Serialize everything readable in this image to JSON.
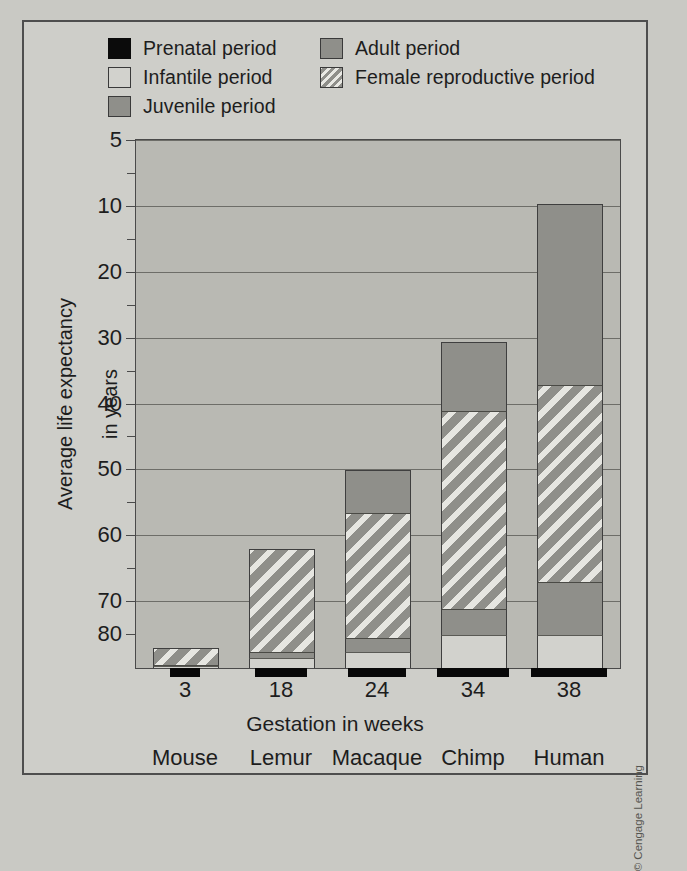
{
  "legend": {
    "items": [
      {
        "label": "Prenatal period",
        "icon": "solid-black-swatch",
        "color": "#0b0b0b",
        "col": "left"
      },
      {
        "label": "Infantile period",
        "icon": "light-grey-swatch",
        "color": "#d2d2cd",
        "col": "left"
      },
      {
        "label": "Juvenile period",
        "icon": "mid-grey-swatch",
        "color": "#8f8f8a",
        "col": "left"
      },
      {
        "label": "Adult period",
        "icon": "mid-grey-swatch",
        "color": "#8f8f8a",
        "col": "right"
      },
      {
        "label": "Female reproductive period",
        "icon": "hatched-swatch",
        "color": "#8f8f8a",
        "col": "right"
      }
    ]
  },
  "axes": {
    "y_title_line1": "Average life expectancy",
    "y_title_line2": "in years",
    "x_title": "Gestation in weeks",
    "y_major_ticks": [
      "80",
      "70",
      "60",
      "50",
      "40",
      "30",
      "20",
      "10",
      "5"
    ],
    "y_minor_ticks": [
      "75",
      "65",
      "55",
      "45",
      "35",
      "25",
      "15"
    ]
  },
  "credit": "© Cengage Learning",
  "chart_data": {
    "type": "bar",
    "stacked": true,
    "title": "",
    "xlabel": "Gestation in weeks",
    "ylabel": "Average life expectancy in years",
    "ylim": [
      0,
      80
    ],
    "ytick_values": [
      5,
      10,
      20,
      30,
      40,
      50,
      60,
      70,
      80
    ],
    "yminor_tick_values": [
      15,
      25,
      35,
      45,
      55,
      65,
      75
    ],
    "grid": true,
    "legend_position": "top",
    "categories": [
      "Mouse",
      "Lemur",
      "Macaque",
      "Chimp",
      "Human"
    ],
    "x": [
      "3",
      "18",
      "24",
      "34",
      "38"
    ],
    "x_units": "weeks gestation",
    "series": [
      {
        "name": "Prenatal period",
        "color": "#0b0b0b",
        "note": "drawn below baseline, proportional to gestation",
        "values": [
          0.06,
          0.35,
          0.46,
          0.65,
          0.73
        ]
      },
      {
        "name": "Infantile period",
        "color": "#d2d2cd",
        "values": [
          0.3,
          1.5,
          2.5,
          5.0,
          5.0
        ]
      },
      {
        "name": "Juvenile period",
        "color": "#8f8f8a",
        "values": [
          0.2,
          1.0,
          2.0,
          4.0,
          8.0
        ]
      },
      {
        "name": "Female reproductive period",
        "color": "#8f8f8a",
        "hatched": true,
        "values": [
          2.5,
          15.5,
          19.0,
          30.0,
          30.0
        ]
      },
      {
        "name": "Adult period",
        "color": "#8f8f8a",
        "values": [
          0.0,
          0.0,
          6.5,
          10.5,
          27.5
        ]
      }
    ],
    "totals": [
      3.0,
      18.0,
      30.0,
      49.5,
      70.5
    ]
  },
  "bars": [
    {
      "species": "Mouse",
      "gestation": "3",
      "left": 17,
      "total": 3.0,
      "segments": [
        {
          "kind": "infantile",
          "label": "Infantile period",
          "value": 0.3
        },
        {
          "kind": "juvenile",
          "label": "Juvenile period",
          "value": 0.2
        },
        {
          "kind": "female",
          "label": "Female reproductive period",
          "value": 2.5
        }
      ]
    },
    {
      "species": "Lemur",
      "gestation": "18",
      "left": 113,
      "total": 18.0,
      "segments": [
        {
          "kind": "infantile",
          "label": "Infantile period",
          "value": 1.5
        },
        {
          "kind": "juvenile",
          "label": "Juvenile period",
          "value": 1.0
        },
        {
          "kind": "female",
          "label": "Female reproductive period",
          "value": 15.5
        }
      ]
    },
    {
      "species": "Macaque",
      "gestation": "24",
      "left": 209,
      "total": 30.0,
      "segments": [
        {
          "kind": "infantile",
          "label": "Infantile period",
          "value": 2.5
        },
        {
          "kind": "juvenile",
          "label": "Juvenile period",
          "value": 2.0
        },
        {
          "kind": "female",
          "label": "Female reproductive period",
          "value": 19.0
        },
        {
          "kind": "adult",
          "label": "Adult period",
          "value": 6.5
        }
      ]
    },
    {
      "species": "Chimp",
      "gestation": "34",
      "left": 305,
      "total": 49.5,
      "segments": [
        {
          "kind": "infantile",
          "label": "Infantile period",
          "value": 5.0
        },
        {
          "kind": "juvenile",
          "label": "Juvenile period",
          "value": 4.0
        },
        {
          "kind": "female",
          "label": "Female reproductive period",
          "value": 30.0
        },
        {
          "kind": "adult",
          "label": "Adult period",
          "value": 10.5
        }
      ]
    },
    {
      "species": "Human",
      "gestation": "38",
      "left": 401,
      "total": 70.5,
      "segments": [
        {
          "kind": "infantile",
          "label": "Infantile period",
          "value": 5.0
        },
        {
          "kind": "juvenile",
          "label": "Juvenile period",
          "value": 8.0
        },
        {
          "kind": "female",
          "label": "Female reproductive period",
          "value": 30.0
        },
        {
          "kind": "adult",
          "label": "Adult period",
          "value": 27.5
        }
      ]
    }
  ],
  "prenatal_widths": [
    30,
    52,
    58,
    72,
    76
  ]
}
